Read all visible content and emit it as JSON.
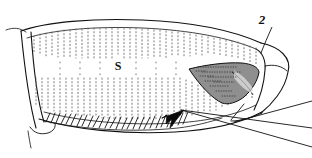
{
  "figure": {
    "type": "scientific-line-drawing",
    "background_color": "#ffffff",
    "ink_color": "#111111",
    "stipple_color": "#6d6d6d",
    "canvas": {
      "width": 312,
      "height": 158
    }
  },
  "labels": [
    {
      "id": "label-s",
      "text": "S",
      "x": 118,
      "y": 66,
      "leader": false,
      "description": "label on central stippled field"
    },
    {
      "id": "label-2",
      "text": "2",
      "x": 262,
      "y": 24,
      "leader": true,
      "leader_from": [
        272,
        27
      ],
      "leader_to": [
        261,
        52
      ],
      "description": "label with leader line to upper right segment margin"
    }
  ],
  "annotations": {
    "arrow": {
      "name": "pointer-arrowhead",
      "tip_x": 182,
      "tip_y": 112,
      "direction": "up-right",
      "color": "#111111"
    },
    "leader_lines": [
      {
        "from": [
          180,
          110
        ],
        "to": [
          312,
          145
        ]
      },
      {
        "from": [
          180,
          110
        ],
        "to": [
          312,
          126
        ]
      },
      {
        "from": [
          233,
          120
        ],
        "to": [
          312,
          100
        ]
      }
    ]
  },
  "outline": {
    "top_edge": "M 22,33 C 40,26 80,22 130,24 C 180,26 226,34 258,45",
    "bottom_edge": "M 40,118 C 80,128 140,132 190,128 C 225,125 252,118 268,110",
    "left_cap": "M 22,33 C 26,60 30,95 40,125",
    "right_cap": "M 258,45 C 276,48 288,58 286,72 C 284,90 272,104 262,112"
  },
  "features": {
    "stipple_bands": 2,
    "spine_row_count": 26,
    "dark_lobe": {
      "name": "dark-stippled-lobe",
      "fill": "#8a8a8a",
      "stroke": "#111111"
    }
  }
}
